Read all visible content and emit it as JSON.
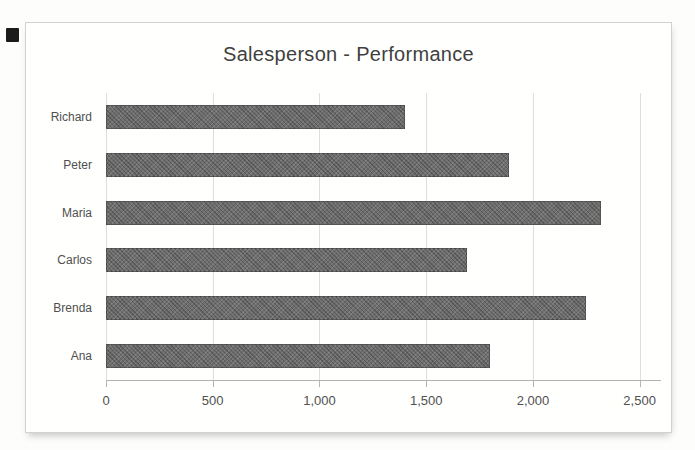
{
  "chart_data": {
    "type": "bar",
    "orientation": "horizontal",
    "title": "Salesperson - Performance",
    "categories": [
      "Richard",
      "Peter",
      "Maria",
      "Carlos",
      "Brenda",
      "Ana"
    ],
    "values": [
      1400,
      1890,
      2320,
      1690,
      2250,
      1800
    ],
    "x_tick_labels": [
      "0",
      "500",
      "1,000",
      "1,500",
      "2,000",
      "2,500"
    ],
    "x_tick_values": [
      0,
      500,
      1000,
      1500,
      2000,
      2500
    ],
    "xlabel": "",
    "ylabel": "",
    "xlim": [
      0,
      2500
    ],
    "axis_span": 2600,
    "grid": "vertical-gridlines-on",
    "legend": "none",
    "bar_color": "#6e6e6e",
    "grid_color": "#dedede",
    "text_color": "#4f4f4f",
    "title_color": "#3f3f3f"
  }
}
